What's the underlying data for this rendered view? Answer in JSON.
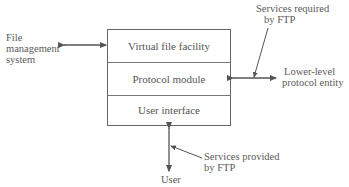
{
  "diagram": {
    "type": "FTP layered architecture",
    "layers": [
      {
        "label": "Virtual file facility"
      },
      {
        "label": "Protocol module"
      },
      {
        "label": "User interface"
      }
    ],
    "external_entities": {
      "file_management": [
        "File",
        "management",
        "system"
      ],
      "lower_level": [
        "Lower-level",
        "protocol entity"
      ],
      "user": "User"
    },
    "annotations": {
      "services_required": [
        "Services required",
        "by FTP"
      ],
      "services_provided": [
        "Services provided",
        "by FTP"
      ]
    },
    "colors": {
      "line": "#666666",
      "text": "#555555",
      "background": "#ffffff"
    }
  }
}
